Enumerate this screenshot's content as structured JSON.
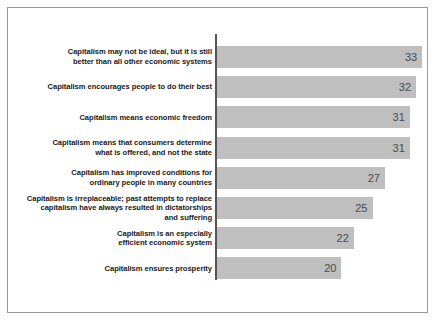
{
  "chart_data": {
    "type": "bar",
    "orientation": "horizontal",
    "title": "",
    "subtitle": "",
    "xlabel": "",
    "ylabel": "",
    "grid": false,
    "legend": false,
    "xlim": [
      0,
      35
    ],
    "axis_line": true,
    "value_labels_inside_bars": true,
    "bar_color": "#bfbfbf",
    "label_color": "#1a1a1a",
    "value_color": "#4a4a4a",
    "categories": [
      "Capitalism may not be ideal, but it is still\nbetter than all other economic systems",
      "Capitalism encourages people to do their best",
      "Capitalism means economic freedom",
      "Capitalism means that consumers determine\nwhat is offered, and not the state",
      "Capitalism has improved conditions for\nordinary people in many countries",
      "Capitalism is irreplaceable; past attempts to replace\ncapitalism have always resulted in dictatorships\nand suffering",
      "Capitalism is an especially\nefficient economic system",
      "Capitalism ensures prosperity"
    ],
    "values": [
      33,
      32,
      31,
      31,
      27,
      25,
      22,
      20
    ],
    "value_labels": [
      "33",
      "32",
      "31",
      "31",
      "27",
      "25",
      "22",
      "20"
    ]
  }
}
